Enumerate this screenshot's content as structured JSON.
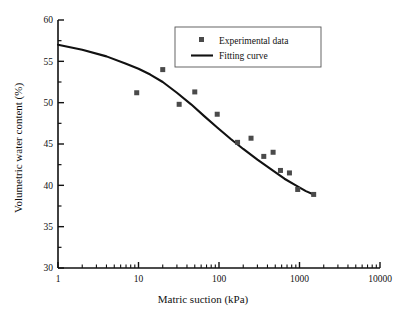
{
  "chart_data": {
    "type": "scatter",
    "title": "",
    "xlabel": "Matric suction (kPa)",
    "ylabel": "Volumetric water content (%)",
    "xscale": "log",
    "yscale": "linear",
    "xlim": [
      1,
      10000
    ],
    "ylim": [
      30,
      60
    ],
    "xticks": [
      1,
      10,
      100,
      1000,
      10000
    ],
    "xtick_labels": [
      "1",
      "10",
      "100",
      "1000",
      "10000"
    ],
    "yticks": [
      30,
      35,
      40,
      45,
      50,
      55,
      60
    ],
    "ytick_labels": [
      "30",
      "35",
      "40",
      "45",
      "50",
      "55",
      "60"
    ],
    "yminor_step": 2.5,
    "xminor": "log-decade",
    "grid": false,
    "legend_position": "top-center",
    "series": [
      {
        "name": "Experimental data",
        "type": "scatter",
        "marker": "square",
        "color": "#4a4a4a",
        "points": [
          {
            "x": 9.5,
            "y": 51.2
          },
          {
            "x": 20,
            "y": 54.0
          },
          {
            "x": 32,
            "y": 49.8
          },
          {
            "x": 50,
            "y": 51.3
          },
          {
            "x": 95,
            "y": 48.6
          },
          {
            "x": 170,
            "y": 45.2
          },
          {
            "x": 250,
            "y": 45.7
          },
          {
            "x": 360,
            "y": 43.5
          },
          {
            "x": 470,
            "y": 44.0
          },
          {
            "x": 580,
            "y": 41.8
          },
          {
            "x": 750,
            "y": 41.5
          },
          {
            "x": 950,
            "y": 39.5
          },
          {
            "x": 1500,
            "y": 38.9
          }
        ]
      },
      {
        "name": "Fitting curve",
        "type": "line",
        "color": "#111111",
        "points": [
          {
            "x": 1,
            "y": 57.0
          },
          {
            "x": 2,
            "y": 56.4
          },
          {
            "x": 4,
            "y": 55.6
          },
          {
            "x": 7,
            "y": 54.7
          },
          {
            "x": 10,
            "y": 54.1
          },
          {
            "x": 14,
            "y": 53.4
          },
          {
            "x": 20,
            "y": 52.5
          },
          {
            "x": 30,
            "y": 51.2
          },
          {
            "x": 45,
            "y": 49.8
          },
          {
            "x": 65,
            "y": 48.4
          },
          {
            "x": 95,
            "y": 47.0
          },
          {
            "x": 140,
            "y": 45.6
          },
          {
            "x": 200,
            "y": 44.4
          },
          {
            "x": 300,
            "y": 43.1
          },
          {
            "x": 450,
            "y": 41.9
          },
          {
            "x": 650,
            "y": 40.8
          },
          {
            "x": 900,
            "y": 40.0
          },
          {
            "x": 1200,
            "y": 39.3
          },
          {
            "x": 1500,
            "y": 38.9
          }
        ]
      }
    ]
  },
  "legend": {
    "entries": [
      {
        "label": "Experimental data",
        "marker": "square"
      },
      {
        "label": "Fitting curve",
        "marker": "line"
      }
    ]
  },
  "colors": {
    "axis": "#111111",
    "marker": "#4a4a4a",
    "curve": "#111111",
    "background": "#ffffff"
  }
}
